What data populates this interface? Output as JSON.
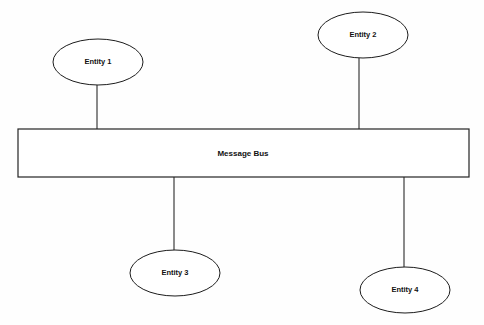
{
  "diagram": {
    "type": "node-bus-diagram",
    "background_color": "#fefefe",
    "stroke_color": "#1c1c1c",
    "fill_color": "#ffffff",
    "text_color": "#111111",
    "bus": {
      "label": "Message Bus",
      "shape": "rectangle",
      "x": 18,
      "y": 129,
      "width": 451,
      "height": 48,
      "label_x": 243,
      "label_y": 153
    },
    "nodes": [
      {
        "id": "entity-1",
        "label": "Entity 1",
        "shape": "ellipse",
        "cx": 98,
        "cy": 62,
        "rx": 45,
        "ry": 23,
        "position": "above-bus"
      },
      {
        "id": "entity-2",
        "label": "Entity 2",
        "shape": "ellipse",
        "cx": 363,
        "cy": 35,
        "rx": 45,
        "ry": 23,
        "position": "above-bus"
      },
      {
        "id": "entity-3",
        "label": "Entity 3",
        "shape": "ellipse",
        "cx": 175,
        "cy": 273,
        "rx": 45,
        "ry": 23,
        "position": "below-bus"
      },
      {
        "id": "entity-4",
        "label": "Entity 4",
        "shape": "ellipse",
        "cx": 405,
        "cy": 290,
        "rx": 45,
        "ry": 23,
        "position": "below-bus"
      }
    ],
    "connectors": [
      {
        "id": "connector-entity-1",
        "from": "entity-1",
        "to": "bus",
        "x": 97,
        "y1": 85,
        "y2": 129
      },
      {
        "id": "connector-entity-2",
        "from": "entity-2",
        "to": "bus",
        "x": 359,
        "y1": 58,
        "y2": 129
      },
      {
        "id": "connector-entity-3",
        "from": "entity-3",
        "to": "bus",
        "x": 174,
        "y1": 177,
        "y2": 250
      },
      {
        "id": "connector-entity-4",
        "from": "entity-4",
        "to": "bus",
        "x": 404,
        "y1": 177,
        "y2": 267
      }
    ]
  }
}
